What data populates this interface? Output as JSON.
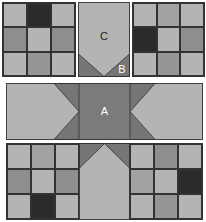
{
  "diagram": {
    "colors": {
      "light": "#b4b4b4",
      "medium_light": "#a2a2a2",
      "medium": "#8e8e8e",
      "dark": "#2b2b2b",
      "piece_a": "#7b7b7b",
      "piece_b": "#767676",
      "piece_c": "#b4b4b4",
      "outline": "#333333"
    },
    "top_left_nine_patch": [
      [
        "light",
        "dark",
        "light"
      ],
      [
        "medium",
        "light",
        "medium"
      ],
      [
        "light",
        "medium",
        "light"
      ]
    ],
    "top_right_nine_patch": [
      [
        "light",
        "medium_light",
        "light"
      ],
      [
        "dark",
        "light",
        "medium"
      ],
      [
        "light",
        "medium",
        "light"
      ]
    ],
    "bottom_left_nine_patch": [
      [
        "light",
        "medium_light",
        "light"
      ],
      [
        "medium",
        "light",
        "medium"
      ],
      [
        "light",
        "dark",
        "light"
      ]
    ],
    "bottom_right_nine_patch": [
      [
        "light",
        "medium",
        "light"
      ],
      [
        "medium_light",
        "light",
        "dark"
      ],
      [
        "light",
        "medium",
        "light"
      ]
    ],
    "labels": {
      "a": "A",
      "b": "B",
      "c": "C"
    }
  }
}
